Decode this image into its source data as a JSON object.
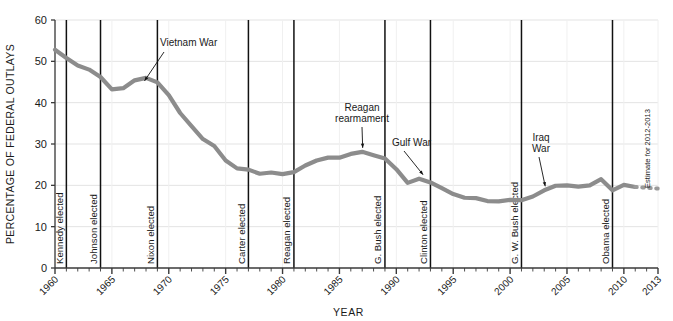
{
  "chart_data": {
    "type": "line",
    "title": "",
    "subtitle": "",
    "xlabel": "YEAR",
    "ylabel": "PERCENTAGE OF FEDERAL OUTLAYS",
    "xlim": [
      1960,
      2013
    ],
    "ylim": [
      0,
      60
    ],
    "y_ticks": [
      0,
      10,
      20,
      30,
      40,
      50,
      60
    ],
    "x_ticks": [
      1960,
      1965,
      1970,
      1975,
      1980,
      1985,
      1990,
      1995,
      2000,
      2005,
      2010,
      2013
    ],
    "x_minor_tick_interval": 1,
    "grid": "horizontal",
    "legend": "none",
    "series": [
      {
        "name": "Defense share of federal outlays",
        "style": "solid",
        "color": "#8c8c8c",
        "x": [
          1960,
          1961,
          1962,
          1963,
          1964,
          1965,
          1966,
          1967,
          1968,
          1969,
          1970,
          1971,
          1972,
          1973,
          1974,
          1975,
          1976,
          1977,
          1978,
          1979,
          1980,
          1981,
          1982,
          1983,
          1984,
          1985,
          1986,
          1987,
          1988,
          1989,
          1990,
          1991,
          1992,
          1993,
          1994,
          1995,
          1996,
          1997,
          1998,
          1999,
          2000,
          2001,
          2002,
          2003,
          2004,
          2005,
          2006,
          2007,
          2008,
          2009,
          2010,
          2011
        ],
        "values": [
          52.8,
          50.8,
          49.0,
          48.0,
          46.2,
          43.2,
          43.5,
          45.4,
          46.0,
          44.9,
          41.8,
          37.5,
          34.3,
          31.2,
          29.5,
          26.0,
          24.1,
          23.8,
          22.8,
          23.1,
          22.7,
          23.2,
          24.8,
          26.0,
          26.7,
          26.7,
          27.6,
          28.1,
          27.3,
          26.5,
          23.9,
          20.6,
          21.6,
          20.7,
          19.3,
          17.9,
          17.0,
          16.9,
          16.2,
          16.1,
          16.5,
          16.4,
          17.3,
          18.8,
          19.9,
          20.0,
          19.7,
          20.0,
          21.5,
          18.8,
          20.1,
          19.6
        ]
      },
      {
        "name": "Estimate",
        "style": "dashed",
        "color": "#9a9a9a",
        "x": [
          2011,
          2012,
          2013
        ],
        "values": [
          19.6,
          19.4,
          19.2
        ]
      }
    ],
    "event_lines": [
      {
        "year": 1961,
        "label": "Kennedy elected"
      },
      {
        "year": 1964,
        "label": "Johnson elected"
      },
      {
        "year": 1969,
        "label": "Nixon elected"
      },
      {
        "year": 1977,
        "label": "Carter elected"
      },
      {
        "year": 1981,
        "label": "Reagan elected"
      },
      {
        "year": 1989,
        "label": "G. Bush elected"
      },
      {
        "year": 1993,
        "label": "Clinton elected"
      },
      {
        "year": 2001,
        "label": "G. W. Bush elected"
      },
      {
        "year": 2009,
        "label": "Obama elected"
      }
    ],
    "annotations": [
      {
        "name": "vietnam-war",
        "text": "Vietnam War",
        "lines": [
          "Vietnam War"
        ],
        "target_year": 1968,
        "target_value": 46.0
      },
      {
        "name": "reagan-rearmament",
        "text": "Reagan rearmament",
        "lines": [
          "Reagan",
          "rearmament"
        ],
        "target_year": 1987,
        "target_value": 28.1
      },
      {
        "name": "gulf-war",
        "text": "Gulf War",
        "lines": [
          "Gulf War"
        ],
        "target_year": 1992,
        "target_value": 21.6
      },
      {
        "name": "iraq-war",
        "text": "Iraq War",
        "lines": [
          "Iraq",
          "War"
        ],
        "target_year": 2003,
        "target_value": 18.8
      },
      {
        "name": "estimate-note",
        "text": "Estimate for 2012-2013",
        "lines": [
          "Estimate for 2012-2013"
        ],
        "orientation": "vertical"
      }
    ],
    "colors": {
      "line": "#8c8c8c",
      "grid": "#e3e3e3",
      "axis": "#3a3a3a",
      "event_line": "#111111",
      "text": "#1a1a1a"
    }
  }
}
